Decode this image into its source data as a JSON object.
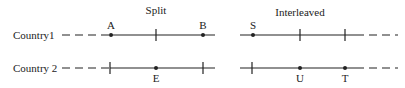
{
  "panels": {
    "split": {
      "title": "Split"
    },
    "interleaved": {
      "title": "Interleaved"
    }
  },
  "rows": [
    {
      "label": "Country1"
    },
    {
      "label": "Country 2"
    }
  ],
  "points": {
    "A": "A",
    "B": "B",
    "E": "E",
    "S": "S",
    "U": "U",
    "T": "T"
  }
}
